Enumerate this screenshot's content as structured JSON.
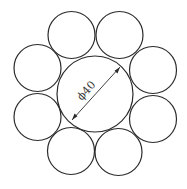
{
  "diagram": {
    "title": "",
    "dimension_label": "ϕ40",
    "center_circle": {
      "cx": 95,
      "cy": 94,
      "r": 38
    },
    "outer_circles": [
      {
        "cx": 71.5,
        "cy": 35,
        "r": 23.5
      },
      {
        "cx": 119.5,
        "cy": 35,
        "r": 23.5
      },
      {
        "cx": 153,
        "cy": 70,
        "r": 23.5
      },
      {
        "cx": 153,
        "cy": 119,
        "r": 23.5
      },
      {
        "cx": 118.5,
        "cy": 152,
        "r": 23.5
      },
      {
        "cx": 71,
        "cy": 151,
        "r": 23.5
      },
      {
        "cx": 37.5,
        "cy": 117,
        "r": 23.5
      },
      {
        "cx": 37.5,
        "cy": 68,
        "r": 23.5
      }
    ],
    "colors": {
      "stroke": "#2b2b2b",
      "background": "#ffffff"
    }
  }
}
